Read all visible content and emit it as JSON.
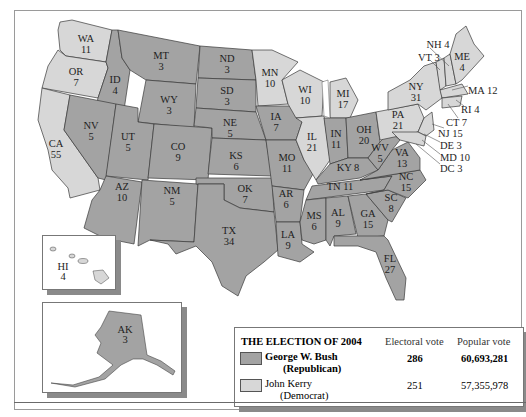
{
  "title": "The Election of 2004",
  "colors": {
    "republican": "#a3a3a3",
    "democrat": "#d7d7d7",
    "border": "#3a3a3a"
  },
  "legend": {
    "title": "THE ELECTION OF 2004",
    "col_electoral": "Electoral vote",
    "col_popular": "Popular vote",
    "rows": [
      {
        "name": "George W. Bush",
        "party": "(Republican)",
        "electoral": "286",
        "popular": "60,693,281",
        "color": "#a3a3a3"
      },
      {
        "name": "John Kerry",
        "party": "(Democrat)",
        "electoral": "251",
        "popular": "57,355,978",
        "color": "#d7d7d7"
      }
    ]
  },
  "states": {
    "WA": {
      "abbr": "WA",
      "ev": "11",
      "winner": "D"
    },
    "OR": {
      "abbr": "OR",
      "ev": "7",
      "winner": "D"
    },
    "CA": {
      "abbr": "CA",
      "ev": "55",
      "winner": "D"
    },
    "ID": {
      "abbr": "ID",
      "ev": "4",
      "winner": "R"
    },
    "NV": {
      "abbr": "NV",
      "ev": "5",
      "winner": "R"
    },
    "MT": {
      "abbr": "MT",
      "ev": "3",
      "winner": "R"
    },
    "WY": {
      "abbr": "WY",
      "ev": "3",
      "winner": "R"
    },
    "UT": {
      "abbr": "UT",
      "ev": "5",
      "winner": "R"
    },
    "CO": {
      "abbr": "CO",
      "ev": "9",
      "winner": "R"
    },
    "AZ": {
      "abbr": "AZ",
      "ev": "10",
      "winner": "R"
    },
    "NM": {
      "abbr": "NM",
      "ev": "5",
      "winner": "R"
    },
    "ND": {
      "abbr": "ND",
      "ev": "3",
      "winner": "R"
    },
    "SD": {
      "abbr": "SD",
      "ev": "3",
      "winner": "R"
    },
    "NE": {
      "abbr": "NE",
      "ev": "5",
      "winner": "R"
    },
    "KS": {
      "abbr": "KS",
      "ev": "6",
      "winner": "R"
    },
    "OK": {
      "abbr": "OK",
      "ev": "7",
      "winner": "R"
    },
    "TX": {
      "abbr": "TX",
      "ev": "34",
      "winner": "R"
    },
    "MN": {
      "abbr": "MN",
      "ev": "10",
      "winner": "D"
    },
    "IA": {
      "abbr": "IA",
      "ev": "7",
      "winner": "R"
    },
    "MO": {
      "abbr": "MO",
      "ev": "11",
      "winner": "R"
    },
    "AR": {
      "abbr": "AR",
      "ev": "6",
      "winner": "R"
    },
    "LA": {
      "abbr": "LA",
      "ev": "9",
      "winner": "R"
    },
    "WI": {
      "abbr": "WI",
      "ev": "10",
      "winner": "D"
    },
    "IL": {
      "abbr": "IL",
      "ev": "21",
      "winner": "D"
    },
    "MI": {
      "abbr": "MI",
      "ev": "17",
      "winner": "D"
    },
    "IN": {
      "abbr": "IN",
      "ev": "11",
      "winner": "R"
    },
    "OH": {
      "abbr": "OH",
      "ev": "20",
      "winner": "R"
    },
    "KY": {
      "abbr": "KY",
      "ev": "8",
      "winner": "R"
    },
    "TN": {
      "abbr": "TN",
      "ev": "11",
      "winner": "R"
    },
    "MS": {
      "abbr": "MS",
      "ev": "6",
      "winner": "R"
    },
    "AL": {
      "abbr": "AL",
      "ev": "9",
      "winner": "R"
    },
    "GA": {
      "abbr": "GA",
      "ev": "15",
      "winner": "R"
    },
    "FL": {
      "abbr": "FL",
      "ev": "27",
      "winner": "R"
    },
    "SC": {
      "abbr": "SC",
      "ev": "8",
      "winner": "R"
    },
    "NC": {
      "abbr": "NC",
      "ev": "15",
      "winner": "R"
    },
    "VA": {
      "abbr": "VA",
      "ev": "13",
      "winner": "R"
    },
    "WV": {
      "abbr": "WV",
      "ev": "5",
      "winner": "R"
    },
    "PA": {
      "abbr": "PA",
      "ev": "21",
      "winner": "D"
    },
    "NY": {
      "abbr": "NY",
      "ev": "31",
      "winner": "D"
    },
    "ME": {
      "abbr": "ME",
      "ev": "4",
      "winner": "D"
    },
    "HI": {
      "abbr": "HI",
      "ev": "4",
      "winner": "D"
    },
    "AK": {
      "abbr": "AK",
      "ev": "3",
      "winner": "R"
    }
  },
  "callouts": {
    "NH": "NH 4",
    "VT": "VT 3",
    "MA": "MA 12",
    "RI": "RI 4",
    "CT": "CT 7",
    "NJ": "NJ 15",
    "DE": "DE 3",
    "MD": "MD 10",
    "DC": "DC 3"
  }
}
